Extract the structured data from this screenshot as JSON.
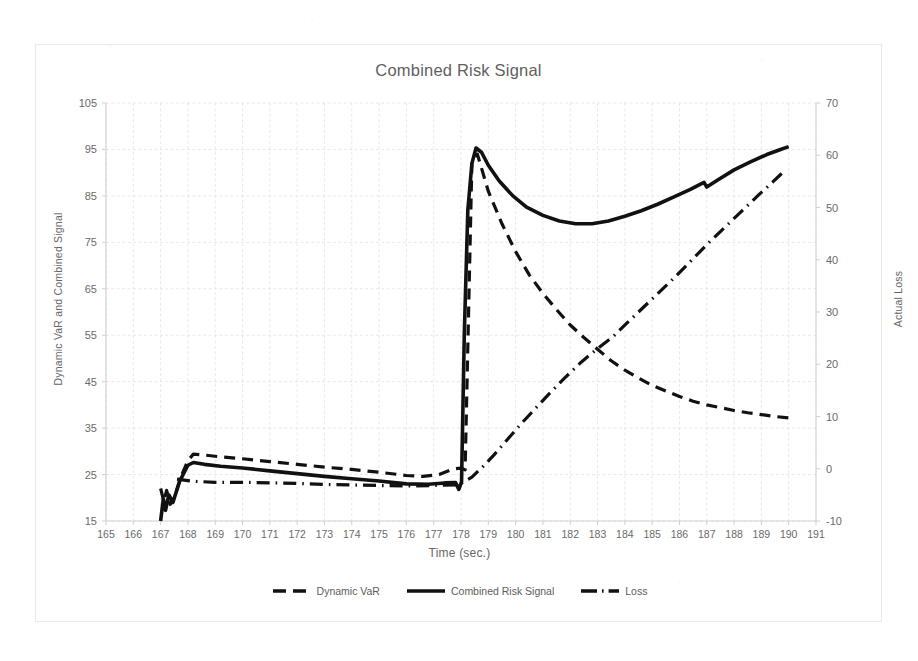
{
  "chart_data": {
    "type": "line",
    "title": "Combined Risk Signal",
    "xlabel": "Time (sec.)",
    "ylabel": "Dynamic VaR and Combined Signal",
    "y2label": "Actual Loss",
    "xlim": [
      165,
      191
    ],
    "ylim": [
      15,
      105
    ],
    "y2lim": [
      -10,
      70
    ],
    "xticks": [
      165,
      166,
      167,
      168,
      169,
      170,
      171,
      172,
      173,
      174,
      175,
      176,
      177,
      178,
      179,
      180,
      181,
      182,
      183,
      184,
      185,
      186,
      187,
      188,
      189,
      190,
      191
    ],
    "yticks": [
      15,
      25,
      35,
      45,
      55,
      65,
      75,
      85,
      95,
      105
    ],
    "y2ticks": [
      -10,
      0,
      10,
      20,
      30,
      40,
      50,
      60,
      70
    ],
    "grid": true,
    "legend_position": "bottom",
    "series": [
      {
        "name": "Dynamic VaR",
        "axis": "left",
        "style": "dashed",
        "color": "#111111",
        "points": [
          [
            167.0,
            22.0
          ],
          [
            167.12,
            19.2
          ],
          [
            167.22,
            21.6
          ],
          [
            167.35,
            18.6
          ],
          [
            167.5,
            20.0
          ],
          [
            167.75,
            24.6
          ],
          [
            168.0,
            28.0
          ],
          [
            168.2,
            29.4
          ],
          [
            168.6,
            29.2
          ],
          [
            169.2,
            28.8
          ],
          [
            170.0,
            28.4
          ],
          [
            171.0,
            27.8
          ],
          [
            172.0,
            27.2
          ],
          [
            173.0,
            26.6
          ],
          [
            174.0,
            26.1
          ],
          [
            175.0,
            25.5
          ],
          [
            176.0,
            24.8
          ],
          [
            176.6,
            24.6
          ],
          [
            177.2,
            25.0
          ],
          [
            177.7,
            26.2
          ],
          [
            178.0,
            26.4
          ],
          [
            178.15,
            26.0
          ],
          [
            178.4,
            92.5
          ],
          [
            178.6,
            94.0
          ],
          [
            179.0,
            86.0
          ],
          [
            179.5,
            79.0
          ],
          [
            180.0,
            73.0
          ],
          [
            180.5,
            68.0
          ],
          [
            181.0,
            64.0
          ],
          [
            181.5,
            60.5
          ],
          [
            182.0,
            57.2
          ],
          [
            182.5,
            54.5
          ],
          [
            183.0,
            52.0
          ],
          [
            183.5,
            49.5
          ],
          [
            184.0,
            47.5
          ],
          [
            184.5,
            45.8
          ],
          [
            185.0,
            44.2
          ],
          [
            185.5,
            43.0
          ],
          [
            186.0,
            41.8
          ],
          [
            186.5,
            40.8
          ],
          [
            187.0,
            40.0
          ],
          [
            187.5,
            39.4
          ],
          [
            188.0,
            38.8
          ],
          [
            188.5,
            38.3
          ],
          [
            189.0,
            37.9
          ],
          [
            189.5,
            37.5
          ],
          [
            190.0,
            37.2
          ]
        ]
      },
      {
        "name": "Combined Risk Signal",
        "axis": "left",
        "style": "solid",
        "color": "#111111",
        "points": [
          [
            167.0,
            15.0
          ],
          [
            167.1,
            19.8
          ],
          [
            167.18,
            17.3
          ],
          [
            167.3,
            20.6
          ],
          [
            167.45,
            19.0
          ],
          [
            167.7,
            23.6
          ],
          [
            168.0,
            27.0
          ],
          [
            168.2,
            27.6
          ],
          [
            168.6,
            27.2
          ],
          [
            169.2,
            26.8
          ],
          [
            170.0,
            26.4
          ],
          [
            171.0,
            25.8
          ],
          [
            172.0,
            25.2
          ],
          [
            173.0,
            24.6
          ],
          [
            174.0,
            24.1
          ],
          [
            175.0,
            23.6
          ],
          [
            176.0,
            23.0
          ],
          [
            176.8,
            22.9
          ],
          [
            177.4,
            23.2
          ],
          [
            177.8,
            23.3
          ],
          [
            177.92,
            21.8
          ],
          [
            178.02,
            23.4
          ],
          [
            178.12,
            55.0
          ],
          [
            178.25,
            82.0
          ],
          [
            178.4,
            92.0
          ],
          [
            178.55,
            95.3
          ],
          [
            178.75,
            94.4
          ],
          [
            179.0,
            91.6
          ],
          [
            179.4,
            88.2
          ],
          [
            179.9,
            85.0
          ],
          [
            180.4,
            82.6
          ],
          [
            181.0,
            80.8
          ],
          [
            181.6,
            79.6
          ],
          [
            182.2,
            79.0
          ],
          [
            182.8,
            79.0
          ],
          [
            183.4,
            79.6
          ],
          [
            184.0,
            80.6
          ],
          [
            184.6,
            81.8
          ],
          [
            185.2,
            83.2
          ],
          [
            185.8,
            84.8
          ],
          [
            186.4,
            86.4
          ],
          [
            186.9,
            87.9
          ],
          [
            187.0,
            86.9
          ],
          [
            187.4,
            88.4
          ],
          [
            188.0,
            90.6
          ],
          [
            188.6,
            92.3
          ],
          [
            189.2,
            93.9
          ],
          [
            189.7,
            95.0
          ],
          [
            190.0,
            95.6
          ]
        ]
      },
      {
        "name": "Loss",
        "axis": "right",
        "style": "dashdot",
        "color": "#111111",
        "points": [
          [
            167.6,
            -2.0
          ],
          [
            168.2,
            -2.4
          ],
          [
            169.0,
            -2.6
          ],
          [
            170.0,
            -2.6
          ],
          [
            171.0,
            -2.7
          ],
          [
            172.0,
            -2.8
          ],
          [
            173.0,
            -3.0
          ],
          [
            174.0,
            -3.1
          ],
          [
            175.0,
            -3.2
          ],
          [
            176.0,
            -3.3
          ],
          [
            177.0,
            -3.2
          ],
          [
            177.8,
            -3.1
          ],
          [
            178.0,
            -2.8
          ],
          [
            178.4,
            -1.6
          ],
          [
            178.8,
            0.4
          ],
          [
            179.2,
            2.6
          ],
          [
            179.7,
            5.6
          ],
          [
            180.2,
            8.6
          ],
          [
            180.7,
            11.4
          ],
          [
            181.2,
            14.2
          ],
          [
            181.8,
            17.4
          ],
          [
            182.4,
            20.4
          ],
          [
            183.0,
            23.0
          ],
          [
            183.55,
            25.2
          ],
          [
            184.1,
            28.0
          ],
          [
            184.7,
            31.0
          ],
          [
            185.3,
            34.0
          ],
          [
            185.9,
            37.0
          ],
          [
            186.5,
            40.2
          ],
          [
            187.1,
            43.4
          ],
          [
            187.7,
            46.4
          ],
          [
            188.3,
            49.4
          ],
          [
            188.9,
            52.4
          ],
          [
            189.4,
            54.8
          ],
          [
            189.8,
            56.8
          ]
        ]
      }
    ]
  },
  "legend": {
    "items": [
      {
        "label": "Dynamic VaR",
        "style": "dashed"
      },
      {
        "label": "Combined Risk Signal",
        "style": "solid"
      },
      {
        "label": "Loss",
        "style": "dashdot"
      }
    ]
  }
}
